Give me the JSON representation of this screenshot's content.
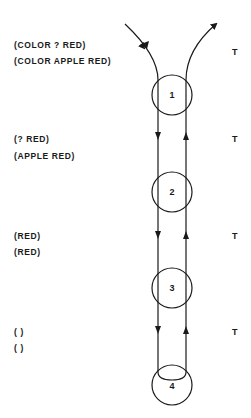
{
  "levels": [
    {
      "pattern": "(COLOR ? RED)",
      "datum": "(COLOR APPLE RED)",
      "result": "T",
      "node": "1"
    },
    {
      "pattern": "(? RED)",
      "datum": "(APPLE RED)",
      "result": "T",
      "node": "2"
    },
    {
      "pattern": "(RED)",
      "datum": "(RED)",
      "result": "T",
      "node": "3"
    },
    {
      "pattern": "( )",
      "datum": "( )",
      "result": "T",
      "node": "4"
    }
  ]
}
